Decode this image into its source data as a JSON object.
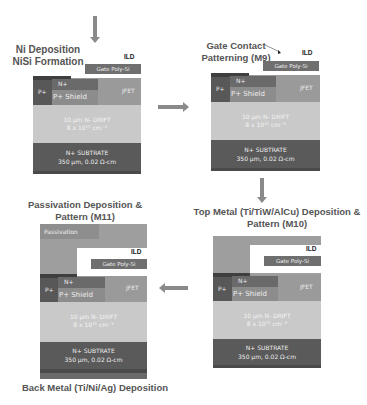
{
  "arrows": {
    "top_in": "down-arrow",
    "p1_to_p2": "right-arrow",
    "p2_to_p3": "down-arrow",
    "p3_to_p4": "left-arrow"
  },
  "layers": {
    "ild": "ILD",
    "gate_poly": "Gate Poly-Si",
    "n_plus": "N+",
    "p_plus": "P+",
    "p_shield": "P+ Shield",
    "jfet": "JFET",
    "drift_line1": "10 μm N- DRIFT",
    "drift_line2": "8 x 10¹⁵ cm⁻³",
    "substrate_line1": "N+ SUBTRATE",
    "substrate_line2": "350 μm, 0.02 Ω-cm",
    "passivation": "Passivation"
  },
  "panels": [
    {
      "id": "step1",
      "title_line1": "Ni Deposition",
      "title_line2": "NiSi Formation"
    },
    {
      "id": "step2",
      "title_line1": "Gate Contact",
      "title_line2": "Patterning (M9)"
    },
    {
      "id": "step3",
      "title_line1": "Top Metal (Ti/TiW/AlCu) Deposition &",
      "title_line2": "Pattern (M10)"
    },
    {
      "id": "step4",
      "title_line1": "Passivation Deposition &",
      "title_line2": "Pattern (M11)",
      "footer": "Back Metal (Ti/Ni/Ag) Deposition"
    }
  ],
  "colors": {
    "gate_poly": "#6f6f6f",
    "n_plus": "#6a6a6a",
    "p_plus": "#585858",
    "p_shield": "#8c8c8c",
    "jfet": "#9a9a9a",
    "drift": "#c9c9c9",
    "substrate": "#5a5a5a",
    "metal": "#9e9e9e",
    "passivation": "#8e8e8e",
    "arrow": "#8a8a8a",
    "title_text": "#555555"
  }
}
